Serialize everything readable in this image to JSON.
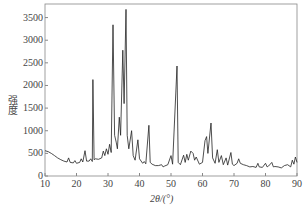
{
  "chart_data": {
    "type": "line",
    "title": "",
    "xlabel": "2θ/(°)",
    "ylabel": "强度",
    "xlim": [
      10,
      90
    ],
    "ylim": [
      0,
      3800
    ],
    "x_ticks": [
      10,
      20,
      30,
      40,
      50,
      60,
      70,
      80,
      90
    ],
    "y_ticks": [
      0,
      500,
      1000,
      1500,
      2000,
      2500,
      3000,
      3500
    ],
    "grid": false,
    "legend": null,
    "series": [
      {
        "name": "XRD pattern",
        "points": [
          [
            10,
            560
          ],
          [
            11,
            540
          ],
          [
            12,
            500
          ],
          [
            13,
            450
          ],
          [
            14,
            400
          ],
          [
            15,
            360
          ],
          [
            16,
            330
          ],
          [
            17,
            310
          ],
          [
            17.5,
            400
          ],
          [
            18,
            300
          ],
          [
            19,
            290
          ],
          [
            19.5,
            340
          ],
          [
            20,
            280
          ],
          [
            21,
            300
          ],
          [
            21.5,
            380
          ],
          [
            22,
            310
          ],
          [
            22.7,
            560
          ],
          [
            23.2,
            330
          ],
          [
            24,
            330
          ],
          [
            24.5,
            380
          ],
          [
            25,
            320
          ],
          [
            25.2,
            2130
          ],
          [
            25.6,
            360
          ],
          [
            26,
            380
          ],
          [
            27,
            370
          ],
          [
            28,
            400
          ],
          [
            28.5,
            550
          ],
          [
            29,
            450
          ],
          [
            29.5,
            600
          ],
          [
            30,
            480
          ],
          [
            30.5,
            700
          ],
          [
            31,
            520
          ],
          [
            31.6,
            3340
          ],
          [
            32.1,
            900
          ],
          [
            32.6,
            750
          ],
          [
            33,
            600
          ],
          [
            33.6,
            1300
          ],
          [
            34,
            900
          ],
          [
            34.7,
            2780
          ],
          [
            35.1,
            1600
          ],
          [
            35.7,
            3680
          ],
          [
            36.1,
            900
          ],
          [
            36.6,
            600
          ],
          [
            37.5,
            1000
          ],
          [
            38,
            450
          ],
          [
            38.6,
            350
          ],
          [
            39.5,
            800
          ],
          [
            40,
            380
          ],
          [
            41,
            280
          ],
          [
            41.5,
            320
          ],
          [
            42,
            270
          ],
          [
            43,
            1120
          ],
          [
            43.4,
            300
          ],
          [
            44,
            260
          ],
          [
            45,
            230
          ],
          [
            46,
            230
          ],
          [
            47,
            250
          ],
          [
            47.5,
            200
          ],
          [
            48,
            220
          ],
          [
            49,
            250
          ],
          [
            50,
            450
          ],
          [
            50.5,
            260
          ],
          [
            51.9,
            2430
          ],
          [
            52.3,
            300
          ],
          [
            53,
            250
          ],
          [
            54,
            460
          ],
          [
            54.5,
            300
          ],
          [
            55,
            480
          ],
          [
            55.5,
            350
          ],
          [
            56.3,
            550
          ],
          [
            57,
            500
          ],
          [
            57.5,
            350
          ],
          [
            58,
            420
          ],
          [
            59,
            260
          ],
          [
            60,
            300
          ],
          [
            60.8,
            780
          ],
          [
            61.3,
            870
          ],
          [
            61.7,
            500
          ],
          [
            62.7,
            1170
          ],
          [
            63.2,
            400
          ],
          [
            64,
            280
          ],
          [
            64.7,
            580
          ],
          [
            65.2,
            300
          ],
          [
            66,
            450
          ],
          [
            66.6,
            250
          ],
          [
            67.5,
            400
          ],
          [
            68,
            240
          ],
          [
            69,
            520
          ],
          [
            69.5,
            260
          ],
          [
            70,
            230
          ],
          [
            71,
            280
          ],
          [
            71.5,
            380
          ],
          [
            72,
            280
          ],
          [
            73,
            250
          ],
          [
            74,
            230
          ],
          [
            75,
            200
          ],
          [
            76,
            210
          ],
          [
            77,
            190
          ],
          [
            77.6,
            280
          ],
          [
            78,
            200
          ],
          [
            79,
            190
          ],
          [
            80,
            280
          ],
          [
            80.5,
            200
          ],
          [
            81,
            220
          ],
          [
            82,
            300
          ],
          [
            82.5,
            200
          ],
          [
            83,
            210
          ],
          [
            84,
            200
          ],
          [
            85,
            180
          ],
          [
            86,
            230
          ],
          [
            87,
            250
          ],
          [
            88,
            200
          ],
          [
            88.5,
            350
          ],
          [
            89,
            260
          ],
          [
            89.5,
            420
          ],
          [
            90,
            300
          ]
        ]
      }
    ]
  }
}
